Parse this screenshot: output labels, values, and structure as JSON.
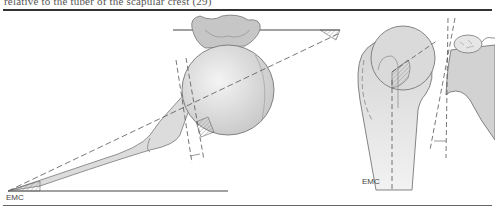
{
  "caption": {
    "text": "relative to the tuber of the scapular crest (29)"
  },
  "figure": {
    "left_panel": {
      "name": "proximal humerus and scapula, axial view",
      "label": "EMC"
    },
    "right_panel": {
      "name": "proximal humerus and glenoid, frontal view",
      "label": "EMC"
    }
  },
  "colors": {
    "bone_fill": "#d9d9d9",
    "bone_stroke": "#777777",
    "rule": "#333333",
    "hatch": "#888888"
  }
}
